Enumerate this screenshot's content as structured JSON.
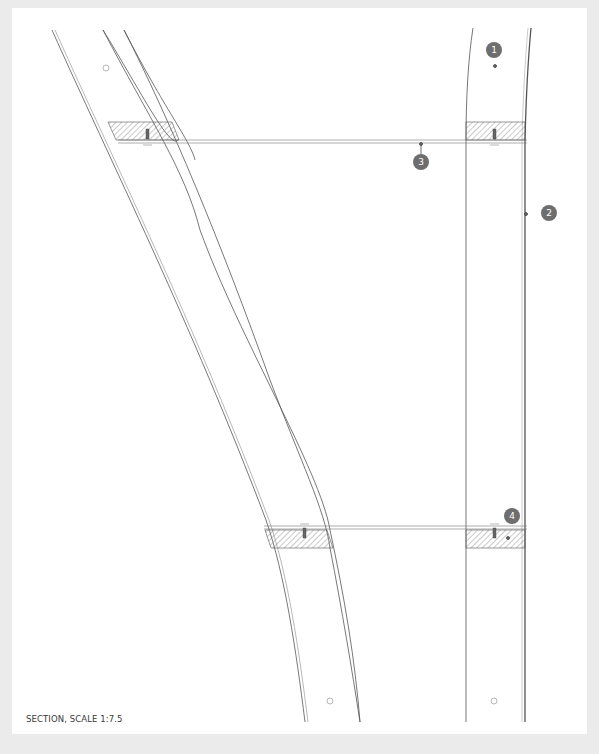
{
  "drawing": {
    "caption": "SECTION, SCALE 1:7.5",
    "callouts": [
      {
        "label": "1",
        "x": 494,
        "y": 20
      },
      {
        "label": "2",
        "x": 549,
        "y": 213
      },
      {
        "label": "3",
        "x": 421,
        "y": 164
      },
      {
        "label": "4",
        "x": 512,
        "y": 516
      }
    ],
    "colors": {
      "background": "#ebebeb",
      "sheet": "#ffffff",
      "line": "#555555",
      "hatch": "#777777",
      "callout": "#6e6e6e"
    }
  }
}
